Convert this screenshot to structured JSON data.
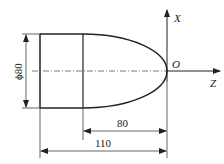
{
  "drawing": {
    "type": "turned part profile with elliptical end",
    "axes": {
      "x_label": "X",
      "z_label": "Z",
      "origin_label": "O"
    },
    "dimensions": {
      "diameter": "ϕ80",
      "length_curve": "80",
      "length_total": "110"
    },
    "colors": {
      "line": "#222222",
      "background": "#ffffff"
    }
  }
}
